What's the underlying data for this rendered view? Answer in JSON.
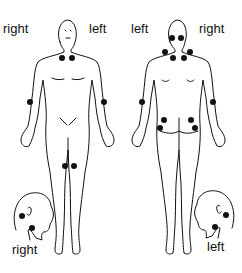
{
  "labels": {
    "front_right": "right",
    "front_left": "left",
    "back_left": "left",
    "back_right": "right",
    "head_right": "right",
    "head_left": "left"
  },
  "colors": {
    "line": "#111111",
    "point": "#111111",
    "background": "#ffffff"
  },
  "points": {
    "front": [
      {
        "name": "low-cervical-right",
        "x": 62,
        "y": 58
      },
      {
        "name": "low-cervical-left",
        "x": 72,
        "y": 58
      },
      {
        "name": "second-rib-right",
        "x": 30,
        "y": 102
      },
      {
        "name": "lateral-epicondyle-left",
        "x": 104,
        "y": 102
      },
      {
        "name": "knee-right",
        "x": 65,
        "y": 166
      },
      {
        "name": "knee-left",
        "x": 74,
        "y": 166
      }
    ],
    "back": [
      {
        "name": "occiput-left",
        "x": 172,
        "y": 38
      },
      {
        "name": "occiput-right",
        "x": 181,
        "y": 38
      },
      {
        "name": "trapezius-left",
        "x": 165,
        "y": 52
      },
      {
        "name": "trapezius-right",
        "x": 190,
        "y": 52
      },
      {
        "name": "supraspinatus-left",
        "x": 173,
        "y": 58
      },
      {
        "name": "supraspinatus-right",
        "x": 184,
        "y": 58
      },
      {
        "name": "elbow-left",
        "x": 142,
        "y": 102
      },
      {
        "name": "elbow-right",
        "x": 213,
        "y": 102
      },
      {
        "name": "gluteal-left",
        "x": 164,
        "y": 120
      },
      {
        "name": "gluteal-right",
        "x": 191,
        "y": 120
      },
      {
        "name": "greater-trochanter-left",
        "x": 160,
        "y": 128
      },
      {
        "name": "greater-trochanter-right",
        "x": 195,
        "y": 128
      }
    ],
    "head_right": [
      {
        "name": "occiput",
        "x": 22,
        "y": 216
      },
      {
        "name": "anterior-cervical",
        "x": 32,
        "y": 228
      }
    ],
    "head_left": [
      {
        "name": "occiput",
        "x": 226,
        "y": 215
      },
      {
        "name": "anterior-cervical",
        "x": 215,
        "y": 227
      }
    ]
  }
}
